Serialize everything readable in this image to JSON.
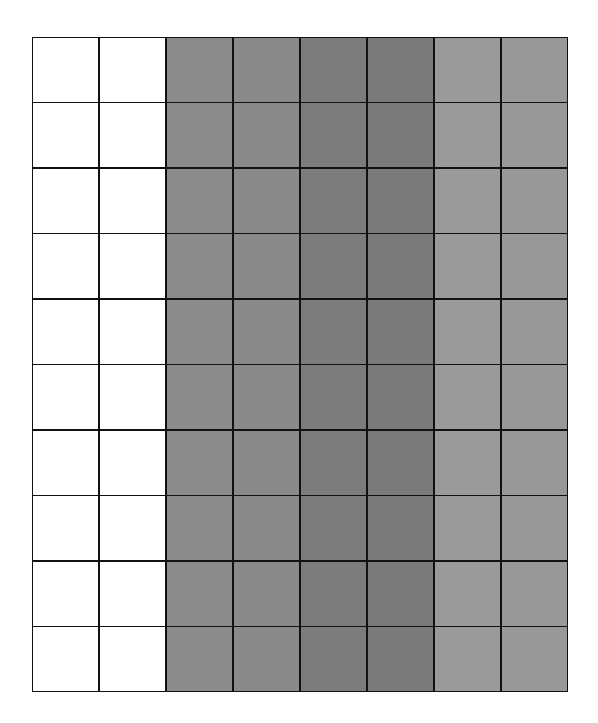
{
  "grid": {
    "rows": 10,
    "columns": 8,
    "line_color": "#111111",
    "column_fills": [
      "#ffffff",
      "#ffffff",
      "#8b8b8b",
      "#8a8a8a",
      "#7c7c7c",
      "#7a7a7a",
      "#9a9a9a",
      "#989898"
    ],
    "column_groups": [
      {
        "name": "white",
        "columns": [
          1,
          2
        ],
        "color": "#ffffff"
      },
      {
        "name": "medium-gray",
        "columns": [
          3,
          4
        ],
        "color": "#8a8a8a"
      },
      {
        "name": "dark-gray",
        "columns": [
          5,
          6
        ],
        "color": "#7b7b7b"
      },
      {
        "name": "light-gray",
        "columns": [
          7,
          8
        ],
        "color": "#999999"
      }
    ]
  }
}
